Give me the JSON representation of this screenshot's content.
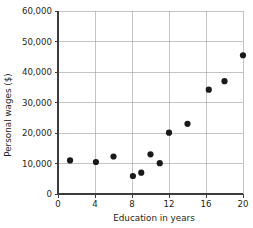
{
  "chart_data": {
    "type": "scatter",
    "title": "",
    "xlabel": "Education in years",
    "ylabel": "Personal wages ($)",
    "xlim": [
      0,
      20
    ],
    "ylim": [
      0,
      60000
    ],
    "xticks": [
      0,
      4,
      8,
      12,
      16,
      20
    ],
    "xtick_labels": [
      "0",
      "4",
      "8",
      "12",
      "16",
      "20"
    ],
    "yticks": [
      0,
      10000,
      20000,
      30000,
      40000,
      50000,
      60000
    ],
    "ytick_labels": [
      "0",
      "10,000",
      "20,000",
      "30,000",
      "40,000",
      "50,000",
      "60,000"
    ],
    "grid": "horizontal-and-vertical",
    "legend": "none",
    "marker": "filled-circle",
    "marker_color": "#1a1a1a",
    "x": [
      1.3,
      4.1,
      6.0,
      8.1,
      9.0,
      10.0,
      11.0,
      12.0,
      14.0,
      16.3,
      18.0,
      20.0
    ],
    "y": [
      11000,
      10500,
      12300,
      5900,
      7000,
      13000,
      10100,
      20100,
      23000,
      34200,
      37000,
      45500
    ],
    "points": [
      {
        "x": 1.3,
        "y": 11000
      },
      {
        "x": 4.1,
        "y": 10500
      },
      {
        "x": 6.0,
        "y": 12300
      },
      {
        "x": 8.1,
        "y": 5900
      },
      {
        "x": 9.0,
        "y": 7000
      },
      {
        "x": 10.0,
        "y": 13000
      },
      {
        "x": 11.0,
        "y": 10100
      },
      {
        "x": 12.0,
        "y": 20100
      },
      {
        "x": 14.0,
        "y": 23000
      },
      {
        "x": 16.3,
        "y": 34200
      },
      {
        "x": 18.0,
        "y": 37000
      },
      {
        "x": 20.0,
        "y": 45500
      }
    ]
  },
  "colors": {
    "background": "#ffffff",
    "marker": "#1a1a1a",
    "grid": "#9c9c9c",
    "axis": "#3c3c3c",
    "text": "#231f20"
  }
}
